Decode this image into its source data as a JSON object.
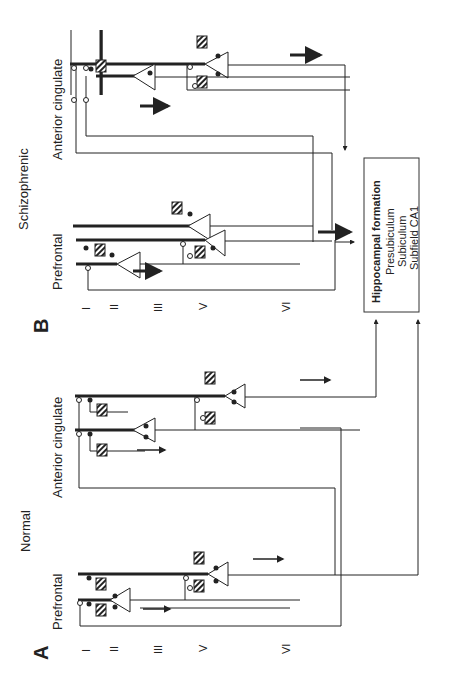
{
  "panels": {
    "A": {
      "letter": "A",
      "condition": "Normal",
      "regions": [
        "Prefrontal",
        "Anterior cingulate"
      ]
    },
    "B": {
      "letter": "B",
      "condition": "Schizophrenic",
      "regions": [
        "Prefrontal",
        "Anterior cingulate"
      ]
    }
  },
  "layers": [
    "I",
    "II",
    "III",
    "V",
    "VI"
  ],
  "target_box": {
    "title": "Hippocampal formation",
    "items": [
      "Presubiculum",
      "Subiculum",
      "Subfield CA1"
    ]
  },
  "legend_symbols": {
    "pyramidal_neuron": "triangle",
    "interneuron": "hatched-square",
    "excitatory_synapse": "open-circle",
    "inhibitory_synapse": "filled-circle"
  },
  "colors": {
    "line": "#333333",
    "background": "#ffffff"
  }
}
